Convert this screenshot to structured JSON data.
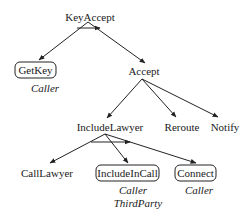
{
  "diagram": {
    "type": "task-tree",
    "nodes": {
      "keyaccept": {
        "label": "KeyAccept",
        "boxed": false,
        "roles": []
      },
      "getkey": {
        "label": "GetKey",
        "boxed": true,
        "roles": [
          "Caller"
        ]
      },
      "accept": {
        "label": "Accept",
        "boxed": false,
        "roles": []
      },
      "includelawyer": {
        "label": "IncludeLawyer",
        "boxed": false,
        "roles": []
      },
      "reroute": {
        "label": "Reroute",
        "boxed": false,
        "roles": []
      },
      "notify": {
        "label": "Notify",
        "boxed": false,
        "roles": []
      },
      "calllawyer": {
        "label": "CallLawyer",
        "boxed": false,
        "roles": []
      },
      "includeincall": {
        "label": "IncludeInCall",
        "boxed": true,
        "roles": [
          "Caller",
          "ThirdParty"
        ]
      },
      "connect": {
        "label": "Connect",
        "boxed": true,
        "roles": [
          "Caller"
        ]
      }
    },
    "edges": [
      {
        "from": "KeyAccept",
        "to": "GetKey"
      },
      {
        "from": "KeyAccept",
        "to": "Accept"
      },
      {
        "from": "Accept",
        "to": "IncludeLawyer"
      },
      {
        "from": "Accept",
        "to": "Reroute"
      },
      {
        "from": "Accept",
        "to": "Notify"
      },
      {
        "from": "IncludeLawyer",
        "to": "CallLawyer"
      },
      {
        "from": "IncludeLawyer",
        "to": "IncludeInCall"
      },
      {
        "from": "IncludeLawyer",
        "to": "Connect"
      }
    ],
    "sequence_arrows": [
      {
        "under": "KeyAccept"
      },
      {
        "under": "IncludeLawyer"
      }
    ]
  }
}
